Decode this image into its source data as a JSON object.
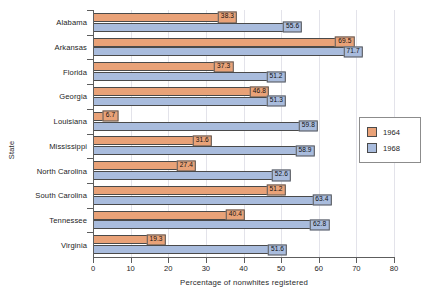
{
  "chart_data": {
    "type": "bar",
    "orientation": "horizontal",
    "title": "",
    "xlabel": "Percentage of nonwhites registered",
    "ylabel": "State",
    "xlim": [
      0,
      80
    ],
    "xticks": [
      0,
      10,
      20,
      30,
      40,
      50,
      60,
      70,
      80
    ],
    "grid": true,
    "legend_position": "right",
    "categories": [
      "Alabama",
      "Arkansas",
      "Florida",
      "Georgia",
      "Louisiana",
      "Mississippi",
      "North Carolina",
      "South Carolina",
      "Tennessee",
      "Virginia"
    ],
    "series": [
      {
        "name": "1964",
        "color": "#e9a278",
        "values": [
          38.3,
          69.5,
          37.3,
          46.8,
          6.7,
          31.6,
          27.4,
          51.2,
          40.4,
          19.3
        ],
        "labels": [
          "38.3",
          "69.5",
          "37.3",
          "46.8",
          "6.7",
          "31.6",
          "27.4",
          "51.2",
          "40.4",
          "19.3"
        ]
      },
      {
        "name": "1968",
        "color": "#a9bcdd",
        "values": [
          55.6,
          71.7,
          51.2,
          51.3,
          59.8,
          58.9,
          52.6,
          63.4,
          62.8,
          51.6
        ],
        "labels": [
          "55.6",
          "71.7",
          "51.2",
          "51.3",
          "59.8",
          "58.9",
          "52.6",
          "63.4",
          "62.8",
          "51.6"
        ]
      }
    ]
  },
  "legend": {
    "entries": [
      {
        "label": "1964",
        "series": "s1964"
      },
      {
        "label": "1968",
        "series": "s1968"
      }
    ]
  }
}
